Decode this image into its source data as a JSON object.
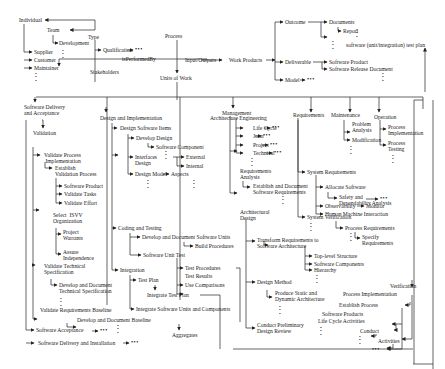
{
  "diagram": {
    "type": "taxonomy-tree",
    "top": {
      "individual": "Individual",
      "team": "Team",
      "type": "Type",
      "development": "Development",
      "supplier": "Supplier",
      "customer": "Customer",
      "maintainer": "Maintainer",
      "qualification": "Qualification",
      "stakeholders": "Stakeholders",
      "performed_by": "isPerformedBy",
      "process": "Process",
      "input_outputs": "Input/Outputs",
      "work_products": "Work Products",
      "units_of_work": "Units of Work",
      "outcome": "Outcome",
      "documents": "Documents",
      "report": "Report",
      "test_plan": "software (unit/integration) test plan",
      "deliverable": "Deliverable",
      "software_product": "Software Product",
      "software_release_document": "Software Release Document",
      "model": "Model"
    },
    "validation_branch": {
      "software_delivery_acceptance": "Software Delivery and Acceptance",
      "validation": "Validation",
      "validate_process_implementation": "Validate Process Implementation",
      "establish_validation_process": "Establish Validation Process",
      "software_product": "Software Product",
      "validate_tasks": "Validate Tasks",
      "validate_effort": "Validate Effort",
      "select_isvv_organization": "Select ISVV Organization",
      "project_warrants": "Project Warrants",
      "assure_independence": "Assure Independence",
      "validate_technical_specification": "Validate Technical Specification",
      "develop_document_technical_specification": "Develop and Document Technical Specification",
      "validate_requirements_baseline": "Validate Requirements Baseline",
      "develop_document_baseline": "Develop and Document Baseline",
      "software_acceptance": "Software Acceptance",
      "software_delivery_installation": "Software Delivery and Installation"
    },
    "design_branch": {
      "design_implementation": "Design and Implementation",
      "design_software_items": "Design Software Items",
      "develop_design": "Develop Design",
      "software_component": "Software Component",
      "interface_design": "Interface Design",
      "external": "External",
      "internal": "Internal",
      "design_model": "Design Model",
      "aspects": "Aspects",
      "coding_testing": "Coding and Testing",
      "develop_document_software_units": "Develop and Document Software Units",
      "build_procedures": "Build Procedures",
      "software_unit_test": "Software Unit Test",
      "test_procedures": "Test Procedures",
      "test_results": "Test Results",
      "use_comparisons": "Use Comparisons",
      "integration": "Integration",
      "test_plan": "Test Plan",
      "integrate_test_plan": "Integrate Test Plan",
      "integrate_software_units_components": "Integrate Software Units and Components",
      "aggregates": "Aggregates"
    },
    "architecture_branch": {
      "architecture_engineering": "Architecture Engineering",
      "management": "Management",
      "life_cycle": "Life Cycle",
      "joint": "Joint",
      "project": "Project",
      "technical": "Technical",
      "requirements_analysis": "Requirements Analysis",
      "establish_document_software_requirements": "Establish and Document Software Requirements",
      "architectural_design": "Architectural Design",
      "transform_requirements": "Transform Requirements to Software Architecture",
      "top_level_structure": "Top-level Structure",
      "software_components": "Software Components",
      "hierarchy": "Hierarchy",
      "design_method": "Design Method",
      "produce_static_dynamic": "Produce Static and Dynamic Architecture",
      "conduct_preliminary_design_review": "Conduct Preliminary Design Review"
    },
    "requirements_branch": {
      "requirements": "Requirements",
      "system_requirements": "System Requirements",
      "allocate_software": "Allocate Software",
      "safety_dependability": "Safety and Dependability Analysis",
      "observability": "Observability",
      "monitor": "Monitor",
      "human_machine_interaction": "Human Machine Interaction",
      "system_verification": "System Verification",
      "process_requirements": "Process Requirements",
      "specify_requirements": "Specify Requirements"
    },
    "maintenance_branch": {
      "maintenance": "Maintenance",
      "problem_analysis": "Problem Analysis",
      "modification": "Modification"
    },
    "operation_branch": {
      "operation": "Operation",
      "process_implementation": "Process Implementation",
      "process_testing": "Process Testing"
    },
    "verification_branch": {
      "verification": "Verification",
      "process_implementation": "Process Implementation",
      "establish_process": "Establish Process",
      "software_products": "Software Products",
      "life_cycle_activities": "Life Cycle Activities",
      "conduct": "Conduct",
      "activities": "Activities"
    },
    "ellipsis": "•••",
    "vellipsis": "•\n•\n•"
  }
}
